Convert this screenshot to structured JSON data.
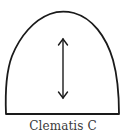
{
  "diagram": {
    "caption": "Clematis C",
    "shape": "arch-template",
    "grain_line": "double-headed-arrow",
    "stroke_color": "#1a1a1a",
    "background": "#ffffff"
  }
}
